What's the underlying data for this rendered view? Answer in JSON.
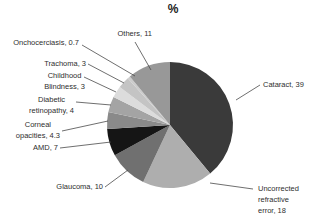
{
  "title": "%",
  "chart_data": {
    "type": "pie",
    "title": "%",
    "unit": "percent",
    "start_angle": "top",
    "direction": "clockwise",
    "legend": "none",
    "label_style": "callouts-with-leader-lines",
    "background": "#ffffff",
    "slices": [
      {
        "name": "Cataract",
        "value": 39,
        "label": "Cataract, 39",
        "color": "#3a3a3a"
      },
      {
        "name": "Uncorrected refractive error",
        "value": 18,
        "label": "Uncorrected\nrefractive\nerror, 18",
        "color": "#aeaeae"
      },
      {
        "name": "Glaucoma",
        "value": 10,
        "label": "Glaucoma, 10",
        "color": "#707070"
      },
      {
        "name": "AMD",
        "value": 7,
        "label": "AMD, 7",
        "color": "#151515"
      },
      {
        "name": "Corneal opacities",
        "value": 4.3,
        "label": "Corneal\nopacities, 4.3",
        "color": "#8a8a8a"
      },
      {
        "name": "Diabetic retinopathy",
        "value": 4,
        "label": "Diabetic\nretinopathy, 4",
        "color": "#a4a4a4"
      },
      {
        "name": "Childhood Blindness",
        "value": 3,
        "label": "Childhood\nBlindness, 3",
        "color": "#dcdcdc"
      },
      {
        "name": "Trachoma",
        "value": 3,
        "label": "Trachoma, 3",
        "color": "#c4c4c4"
      },
      {
        "name": "Onchocerciasis",
        "value": 0.7,
        "label": "Onchocerciasis, 0.7",
        "color": "#cccccc"
      },
      {
        "name": "Others",
        "value": 11,
        "label": "Others, 11",
        "color": "#989898"
      }
    ]
  }
}
